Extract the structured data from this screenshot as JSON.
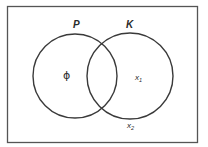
{
  "diagram": {
    "type": "venn",
    "universe": {
      "border_color": "#555555"
    },
    "sets": [
      {
        "name": "P",
        "label": "P",
        "cx": 75,
        "cy": 76,
        "r": 42
      },
      {
        "name": "K",
        "label": "K",
        "cx": 130,
        "cy": 76,
        "r": 43
      }
    ],
    "elements": [
      {
        "label": "ϕ",
        "region": "P only"
      },
      {
        "label": "x",
        "sub": "1",
        "region": "K only"
      },
      {
        "label": "x",
        "sub": "2",
        "region": "outside both"
      }
    ],
    "stroke_color": "#3a3a3a"
  }
}
